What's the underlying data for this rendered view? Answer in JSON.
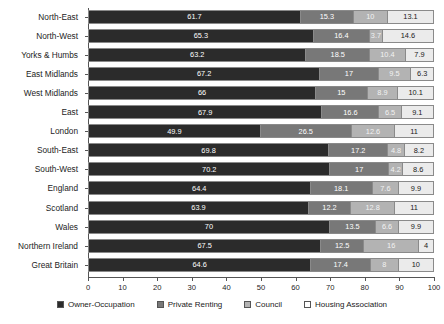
{
  "chart_data": {
    "type": "bar",
    "subtype": "stacked-horizontal-100pct",
    "title": "",
    "xlabel": "",
    "ylabel": "",
    "xlim": [
      0,
      100
    ],
    "xticks": [
      0,
      10,
      20,
      30,
      40,
      50,
      60,
      70,
      80,
      90,
      100
    ],
    "grid": false,
    "legend_position": "bottom",
    "categories": [
      "North-East",
      "North-West",
      "Yorks & Humbs",
      "East Midlands",
      "West Midlands",
      "East",
      "London",
      "South-East",
      "South-West",
      "England",
      "Scotland",
      "Wales",
      "Northern Ireland",
      "Great Britain"
    ],
    "series": [
      {
        "name": "Owner-Occupation",
        "color": "#2b2b2b",
        "values": [
          61.7,
          65.3,
          63.2,
          67.2,
          66,
          67.9,
          49.9,
          69.8,
          70.2,
          64.4,
          63.9,
          70,
          67.5,
          64.6
        ]
      },
      {
        "name": "Private Renting",
        "color": "#787878",
        "values": [
          15.3,
          16.4,
          18.5,
          17,
          15,
          16.6,
          26.5,
          17.2,
          17,
          18.1,
          12.2,
          13.5,
          12.5,
          17.4
        ]
      },
      {
        "name": "Council",
        "color": "#b3b3b3",
        "values": [
          10,
          3.7,
          10.4,
          9.5,
          8.9,
          6.5,
          12.6,
          4.8,
          4.2,
          7.6,
          12.8,
          6.6,
          16,
          8
        ]
      },
      {
        "name": "Housing Association",
        "color": "#ebebeb",
        "values": [
          13.1,
          14.6,
          7.9,
          6.3,
          10.1,
          9.1,
          11,
          8.2,
          8.6,
          9.9,
          11,
          9.9,
          4,
          10
        ]
      }
    ],
    "data_labels": [
      [
        "61.7",
        "15.3",
        "10",
        "13.1"
      ],
      [
        "65.3",
        "16.4",
        "3.7",
        "14.6"
      ],
      [
        "63.2",
        "18.5",
        "10.4",
        "7.9"
      ],
      [
        "67.2",
        "17",
        "9.5",
        "6.3"
      ],
      [
        "66",
        "15",
        "8.9",
        "10.1"
      ],
      [
        "67.9",
        "16.6",
        "6.5",
        "9.1"
      ],
      [
        "49.9",
        "26.5",
        "12.6",
        "11"
      ],
      [
        "69.8",
        "17.2",
        "4.8",
        "8.2"
      ],
      [
        "70.2",
        "17",
        "4.2",
        "8.6"
      ],
      [
        "64.4",
        "18.1",
        "7.6",
        "9.9"
      ],
      [
        "63.9",
        "12.2",
        "12.8",
        "11"
      ],
      [
        "70",
        "13.5",
        "6.6",
        "9.9"
      ],
      [
        "67.5",
        "12.5",
        "16",
        "4"
      ],
      [
        "64.6",
        "17.4",
        "8",
        "10"
      ]
    ]
  },
  "legend": {
    "items": [
      {
        "label": "Owner-Occupation"
      },
      {
        "label": "Private Renting"
      },
      {
        "label": "Council"
      },
      {
        "label": "Housing Association"
      }
    ]
  }
}
